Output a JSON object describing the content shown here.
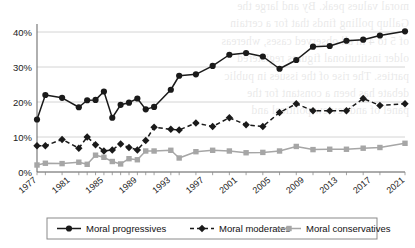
{
  "chart_data": {
    "type": "line",
    "title": "",
    "subtitle": "",
    "xlabel": "",
    "ylabel": "",
    "xlim": [
      1977,
      2021
    ],
    "ylim": [
      0,
      42
    ],
    "ytick_labels": [
      "0%",
      "10%",
      "20%",
      "30%",
      "40%"
    ],
    "ytick_values": [
      0,
      10,
      20,
      30,
      40
    ],
    "xtick_labels": [
      "1977",
      "1981",
      "1985",
      "1989",
      "1993",
      "1997",
      "2001",
      "2005",
      "2009",
      "2013",
      "2017",
      "2021"
    ],
    "xtick_values": [
      1977,
      1981,
      1985,
      1989,
      1993,
      1997,
      2001,
      2005,
      2009,
      2013,
      2017,
      2021
    ],
    "grid": "horizontal",
    "legend_position": "bottom",
    "x": [
      1977,
      1978,
      1980,
      1982,
      1983,
      1984,
      1985,
      1986,
      1987,
      1988,
      1989,
      1990,
      1991,
      1993,
      1994,
      1996,
      1998,
      2000,
      2002,
      2004,
      2006,
      2008,
      2010,
      2012,
      2014,
      2016,
      2018,
      2021
    ],
    "series": [
      {
        "name": "Moral progressives",
        "marker": "circle",
        "line_style": "solid",
        "color": "#1a1a1a",
        "values": [
          15.0,
          22.0,
          21.2,
          18.5,
          20.5,
          20.6,
          23.0,
          15.5,
          19.2,
          19.8,
          21.0,
          17.9,
          18.6,
          23.5,
          27.5,
          27.9,
          30.3,
          33.5,
          34.0,
          33.0,
          29.5,
          32.0,
          35.8,
          36.0,
          37.5,
          37.8,
          39.0,
          40.2
        ]
      },
      {
        "name": "Moral moderates",
        "marker": "diamond",
        "line_style": "dashed",
        "color": "#1a1a1a",
        "values": [
          7.5,
          7.5,
          9.3,
          6.8,
          10.0,
          7.8,
          6.0,
          6.3,
          8.0,
          7.0,
          6.3,
          9.0,
          12.8,
          12.2,
          12.0,
          14.0,
          13.0,
          15.5,
          13.5,
          13.0,
          17.0,
          19.5,
          17.5,
          17.5,
          17.5,
          21.0,
          19.0,
          19.5
        ]
      },
      {
        "name": "Moral conservatives",
        "marker": "square",
        "line_style": "solid",
        "color": "#a6a6a6",
        "values": [
          2.0,
          2.5,
          2.4,
          2.8,
          2.2,
          4.8,
          4.2,
          3.0,
          2.3,
          3.8,
          3.5,
          6.0,
          6.0,
          6.2,
          4.0,
          5.8,
          6.2,
          6.0,
          5.5,
          5.6,
          6.0,
          7.3,
          6.4,
          6.5,
          6.5,
          6.8,
          7.0,
          8.2
        ]
      }
    ]
  },
  "legend": {
    "items": [
      {
        "label": "Moral progressives"
      },
      {
        "label": "Moral moderates"
      },
      {
        "label": "Moral conservatives"
      }
    ]
  },
  "bleed_text": {
    "lines": [
      "moral values peak. By and large the",
      "Gallup polling finds that for a certain",
      "of 5 to 4 in all observed cases, whereas",
      "older institutional figures   registered",
      "parties. The rise of the issues in public",
      "debate has been a constant for the",
      "panel of   and review     political and"
    ]
  }
}
